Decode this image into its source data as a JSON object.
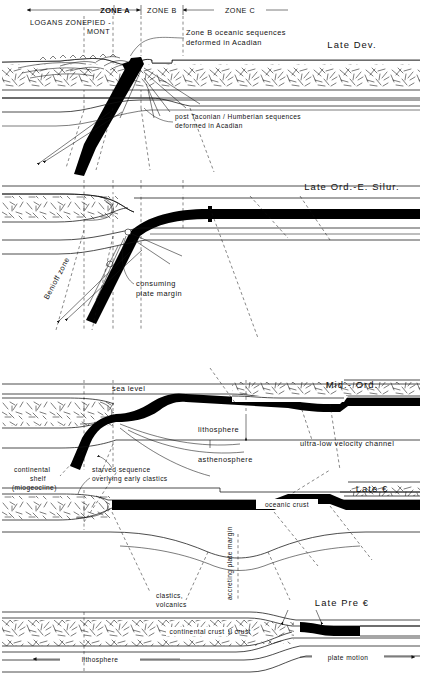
{
  "figure": {
    "type": "geologic-cross-section-series"
  },
  "zone_header": {
    "zones": [
      {
        "id": "zone-a",
        "label": "ZONE A"
      },
      {
        "id": "zone-b",
        "label": "ZONE B"
      },
      {
        "id": "zone-c",
        "label": "ZONE C"
      }
    ],
    "subzones": [
      {
        "id": "logans-zone",
        "label": "LOGANS ZONE"
      },
      {
        "id": "piedmont",
        "line1": "PIED -",
        "line2": "MONT"
      }
    ]
  },
  "panels": [
    {
      "id": "panel-late-dev",
      "era": "Late Dev.",
      "annotations": [
        {
          "id": "zone-b-oceanic",
          "line1": "Zone B oceanic  sequences",
          "line2": "deformed  in Acadian"
        },
        {
          "id": "post-taconian",
          "line1": "post Taconian / Humberian sequences",
          "line2": "deformed  in  Acadian"
        }
      ]
    },
    {
      "id": "panel-late-ord-e-silur",
      "era": "Late Ord.-E. Silur.",
      "annotations": [
        {
          "id": "benioff-zone",
          "label": "Benioff zone"
        },
        {
          "id": "consuming-plate-margin",
          "line1": "consuming",
          "line2": "plate margin"
        }
      ]
    },
    {
      "id": "panel-mid-ord",
      "era": "Mid.- Ord.",
      "annotations": [
        {
          "id": "sea-level",
          "label": "sea level"
        },
        {
          "id": "lithosphere",
          "label": "lithosphere"
        },
        {
          "id": "asthenosphere",
          "label": "asthenosphere"
        },
        {
          "id": "ultra-low-velocity-channel",
          "label": "ultra-low  velocity  channel"
        }
      ]
    },
    {
      "id": "panel-late-cambrian",
      "era": "Late €",
      "annotations": [
        {
          "id": "continental-shelf",
          "line1": "continental",
          "line2": "shelf",
          "line3": "(miogeocline)"
        },
        {
          "id": "starved-sequence",
          "line1": "starved  sequence",
          "line2": "overlying early clastics"
        },
        {
          "id": "oceanic-crust",
          "label": "oceanic crust"
        },
        {
          "id": "accreting-plate-margin",
          "label": "accreting plate margin"
        },
        {
          "id": "clastics-volcanics",
          "line1": "clastics,",
          "line2": "volcanics"
        }
      ]
    },
    {
      "id": "panel-late-precambrian",
      "era": "Late  Pre €",
      "annotations": [
        {
          "id": "continental-crust",
          "label": "continental crust"
        },
        {
          "id": "lithosphere-bottom",
          "label": "lithosphere"
        },
        {
          "id": "plate-motion",
          "label": "plate  motion"
        }
      ]
    }
  ],
  "colors": {
    "ink": "#111111",
    "slab": "#000000",
    "background": "#ffffff"
  }
}
